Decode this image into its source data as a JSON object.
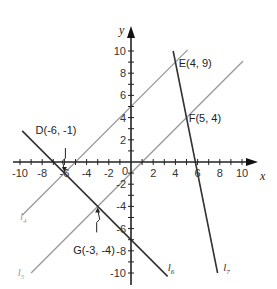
{
  "chart_data": {
    "type": "line",
    "title": "",
    "xlabel": "x",
    "ylabel": "y",
    "xlim": [
      -10.5,
      11
    ],
    "ylim": [
      -11,
      11.5
    ],
    "grid": false,
    "x_ticks": [
      -10,
      -8,
      -6,
      -4,
      -2,
      2,
      4,
      6,
      8,
      10
    ],
    "y_ticks": [
      -10,
      -8,
      -6,
      -4,
      -2,
      2,
      4,
      6,
      8,
      10
    ],
    "origin_label": "0",
    "series": [
      {
        "name": "l4",
        "label_base": "l",
        "label_sub": "4",
        "slope": 1,
        "intercept": 5,
        "x_range": [
          -9.8,
          5.1
        ],
        "color": "#9a9a9a",
        "label_at": [
          -10,
          -5.2
        ]
      },
      {
        "name": "l5",
        "label_base": "l",
        "label_sub": "5",
        "slope": 1,
        "intercept": -1,
        "x_range": [
          -9,
          10.1
        ],
        "color": "#9a9a9a",
        "label_at": [
          -10.2,
          -10.3
        ]
      },
      {
        "name": "l6",
        "label_base": "l",
        "label_sub": "6",
        "slope": -1,
        "intercept": -7,
        "x_range": [
          -9.8,
          3.3
        ],
        "color": "#333333",
        "label_at": [
          3.3,
          -9.8
        ]
      },
      {
        "name": "l7",
        "label_base": "l",
        "label_sub": "7",
        "slope": -5,
        "intercept": 29,
        "x_range": [
          3.8,
          7.8
        ],
        "color": "#333333",
        "label_at": [
          8.3,
          -9.8
        ]
      }
    ],
    "points": [
      {
        "name": "D",
        "label": "D(-6, -1)",
        "x": -6,
        "y": -1,
        "label_at": [
          -8.6,
          2.5
        ],
        "pointer": true
      },
      {
        "name": "E",
        "label": "E(4, 9)",
        "x": 4,
        "y": 9,
        "label_at": [
          4.3,
          8.6
        ],
        "pointer": false
      },
      {
        "name": "F",
        "label": "F(5, 4)",
        "x": 5,
        "y": 4,
        "label_at": [
          5.2,
          3.6
        ],
        "pointer": false
      },
      {
        "name": "G",
        "label": "G(-3, -4)",
        "x": -3,
        "y": -4,
        "label_at": [
          -5.2,
          -8.3
        ],
        "pointer": true
      }
    ]
  }
}
